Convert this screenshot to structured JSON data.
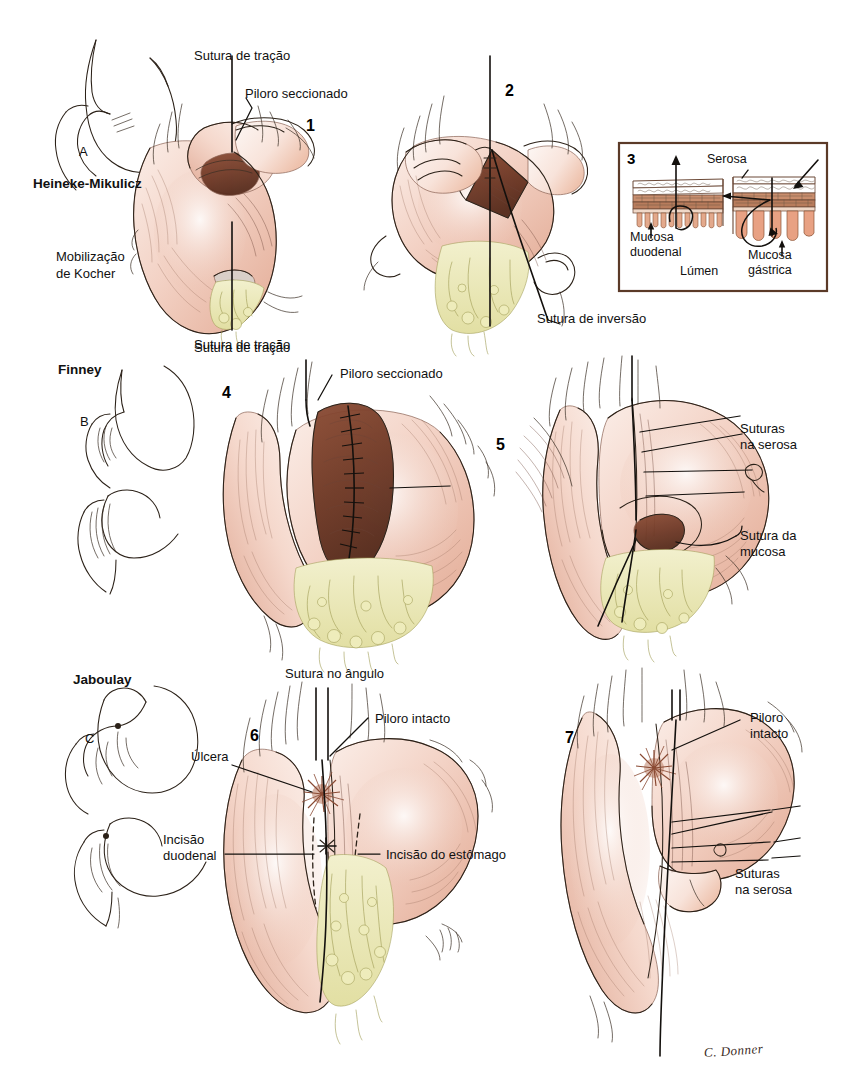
{
  "figure": {
    "type": "medical-surgical-illustration",
    "title_text": "",
    "language": "pt-BR",
    "signature": "C. Donner",
    "background_color": "#ffffff",
    "palette": {
      "tissue_pink": "#f2cfc3",
      "tissue_pink_deep": "#e0ab98",
      "mucosa_dark": "#6b3b2a",
      "omentum_yellow": "#ebe9b8",
      "ink": "#2b2118",
      "inset_border": "#5b3a28",
      "mucosa_gastrica": "#e8a183",
      "serosa_line": "#b06a4e"
    }
  },
  "rows": [
    {
      "id": "heineke-mikulicz",
      "technique_label": "Heineke-Mikulicz",
      "schematic_letter": "A",
      "side_note": "Mobilização\nde Kocher",
      "panels": [
        {
          "number": "1",
          "labels": [
            {
              "text": "Sutura de tração",
              "position": "top"
            },
            {
              "text": "Piloro seccionado",
              "position": "top-right"
            },
            {
              "text": "Sutura de tração",
              "position": "bottom"
            }
          ]
        },
        {
          "number": "2",
          "labels": [
            {
              "text": "Sutura de inversão",
              "position": "bottom-right"
            }
          ]
        },
        {
          "number": "3",
          "type": "inset-detail",
          "labels": [
            {
              "text": "Serosa",
              "position": "top-center"
            },
            {
              "text": "Mucosa\nduodenal",
              "position": "left"
            },
            {
              "text": "Lúmen",
              "position": "bottom-center"
            },
            {
              "text": "Mucosa\ngástrica",
              "position": "right"
            }
          ]
        }
      ]
    },
    {
      "id": "finney",
      "technique_label": "Finney",
      "schematic_letter": "B",
      "side_note": "",
      "panels": [
        {
          "number": "4",
          "labels": [
            {
              "text": "Sutura de tração",
              "position": "top"
            },
            {
              "text": "Piloro seccionado",
              "position": "top-right"
            }
          ]
        },
        {
          "number": "5",
          "labels": [
            {
              "text": "Suturas\nna serosa",
              "position": "right"
            },
            {
              "text": "Sutura da\nmucosa",
              "position": "right-lower"
            }
          ]
        }
      ]
    },
    {
      "id": "jaboulay",
      "technique_label": "Jaboulay",
      "schematic_letter": "C",
      "side_note": "",
      "panels": [
        {
          "number": "6",
          "labels": [
            {
              "text": "Sutura no ângulo",
              "position": "top"
            },
            {
              "text": "Piloro intacto",
              "position": "top-right"
            },
            {
              "text": "Úlcera",
              "position": "left"
            },
            {
              "text": "Incisão\nduodenal",
              "position": "left-lower"
            },
            {
              "text": "Incisão do estômago",
              "position": "right-lower"
            }
          ]
        },
        {
          "number": "7",
          "labels": [
            {
              "text": "Piloro\nintacto",
              "position": "top-right"
            },
            {
              "text": "Suturas\nna serosa",
              "position": "right"
            }
          ]
        }
      ]
    }
  ],
  "labels": {
    "heineke_mikulicz": "Heineke-Mikulicz",
    "finney": "Finney",
    "jaboulay": "Jaboulay",
    "letter_a": "A",
    "letter_b": "B",
    "letter_c": "C",
    "mobilizacao_kocher": "Mobilização",
    "mobilizacao_kocher_2": "de Kocher",
    "sutura_tracao_1": "Sutura de tração",
    "piloro_seccionado_1": "Piloro seccionado",
    "sutura_tracao_2": "Sutura de tração",
    "sutura_inversao": "Sutura de inversão",
    "serosa": "Serosa",
    "mucosa_duodenal_1": "Mucosa",
    "mucosa_duodenal_2": "duodenal",
    "lumen": "Lúmen",
    "mucosa_gastrica_1": "Mucosa",
    "mucosa_gastrica_2": "gástrica",
    "sutura_tracao_4": "Sutura de tração",
    "piloro_seccionado_4": "Piloro seccionado",
    "suturas_serosa_5a": "Suturas",
    "suturas_serosa_5b": "na serosa",
    "sutura_mucosa_5a": "Sutura da",
    "sutura_mucosa_5b": "mucosa",
    "sutura_angulo": "Sutura no ângulo",
    "piloro_intacto_6": "Piloro intacto",
    "ulcera": "Úlcera",
    "incisao_duodenal_1": "Incisão",
    "incisao_duodenal_2": "duodenal",
    "incisao_estomago": "Incisão do estômago",
    "piloro_intacto_7a": "Piloro",
    "piloro_intacto_7b": "intacto",
    "suturas_serosa_7a": "Suturas",
    "suturas_serosa_7b": "na serosa",
    "num_1": "1",
    "num_2": "2",
    "num_3": "3",
    "num_4": "4",
    "num_5": "5",
    "num_6": "6",
    "num_7": "7",
    "signature": "C. Donner"
  }
}
